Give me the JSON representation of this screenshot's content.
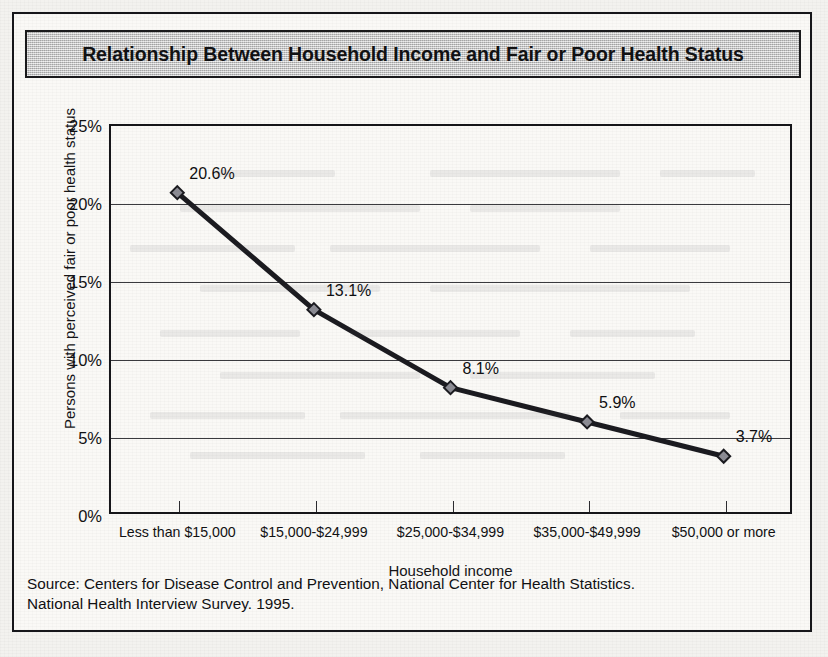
{
  "figure": {
    "title": "Relationship Between Household Income and Fair or Poor Health Status",
    "source_line1": "Source:  Centers for Disease Control and Prevention, National Center for Health Statistics.",
    "source_line2": "National Health Interview Survey. 1995."
  },
  "colors": {
    "paper": "#faf9f6",
    "ink": "#16161a",
    "banner_fill": "#c9c9c9",
    "series_line": "#1b1b20",
    "marker_fill": "#8c8c94"
  },
  "chart_data": {
    "type": "line",
    "title": "Relationship Between Household Income and Fair or Poor Health Status",
    "xlabel": "Household income",
    "ylabel": "Persons with perceived fair or poor health status",
    "categories": [
      "Less than $15,000",
      "$15,000-$24,999",
      "$25,000-$34,999",
      "$35,000-$49,999",
      "$50,000 or more"
    ],
    "values": [
      20.6,
      13.1,
      8.1,
      5.9,
      3.7
    ],
    "point_labels": [
      "20.6%",
      "13.1%",
      "8.1%",
      "5.9%",
      "3.7%"
    ],
    "ylim": [
      0,
      25
    ],
    "yticks": [
      0,
      5,
      10,
      15,
      20,
      25
    ],
    "ytick_labels": [
      "0%",
      "5%",
      "10%",
      "15%",
      "20%",
      "25%"
    ],
    "grid": true,
    "grid_axis": "y",
    "legend": "none",
    "marker": "diamond"
  }
}
